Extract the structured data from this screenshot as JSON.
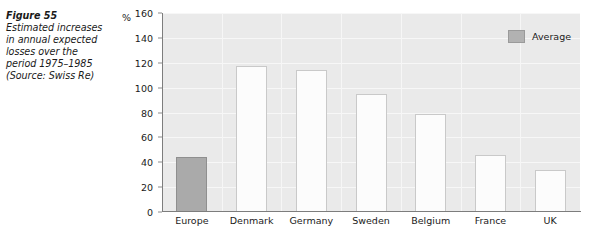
{
  "caption": {
    "title": "Figure 55",
    "body": "Estimated increases in annual expected losses over the period 1975–1985 (Source: Swiss Re)"
  },
  "axis": {
    "unit_label": "%",
    "y_ticks": [
      "160",
      "140",
      "120",
      "100",
      "80",
      "60",
      "40",
      "20",
      "0"
    ]
  },
  "legend": {
    "label": "Average"
  },
  "colors": {
    "plot_background": "#eaeaea",
    "gridline": "#f7f7f7",
    "axis": "#7d7d7d",
    "average_bar": "#aaaaaa",
    "average_bar_border": "#8f8f8f",
    "bar": "#fcfcfc",
    "bar_border": "#c9c9c9",
    "text": "#1a1a1a"
  },
  "chart_data": {
    "type": "bar",
    "title": "Estimated increases in annual expected losses over the period 1975–1985",
    "xlabel": "",
    "ylabel": "%",
    "ylim": [
      0,
      160
    ],
    "ytick_step": 20,
    "grid": true,
    "legend_position": "top-right",
    "categories": [
      "Europe",
      "Denmark",
      "Germany",
      "Sweden",
      "Belgium",
      "France",
      "UK"
    ],
    "values": [
      44,
      117,
      114,
      95,
      79,
      46,
      34
    ],
    "series": [
      {
        "name": "Average",
        "highlighted_categories": [
          "Europe"
        ]
      }
    ],
    "legend_entries": [
      "Average"
    ]
  }
}
